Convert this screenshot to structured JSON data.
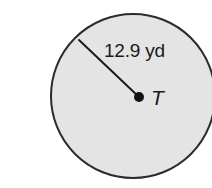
{
  "figure": {
    "type": "circle-with-radius",
    "background_color": "#ffffff",
    "circle": {
      "fill_color": "#e4e4e4",
      "stroke_color": "#2b2b2b",
      "stroke_width": 2,
      "center_x": 133,
      "center_y": 96,
      "radius_px": 82
    },
    "center_point": {
      "label": "T",
      "dot_color": "#111111",
      "dot_radius_px": 5,
      "x": 139,
      "y": 97
    },
    "radius_segment": {
      "label": "12.9 yd",
      "value": 12.9,
      "unit": "yd",
      "stroke_color": "#1a1a1a",
      "stroke_width": 2,
      "from_x": 79,
      "from_y": 40,
      "to_x": 139,
      "to_y": 97
    }
  }
}
